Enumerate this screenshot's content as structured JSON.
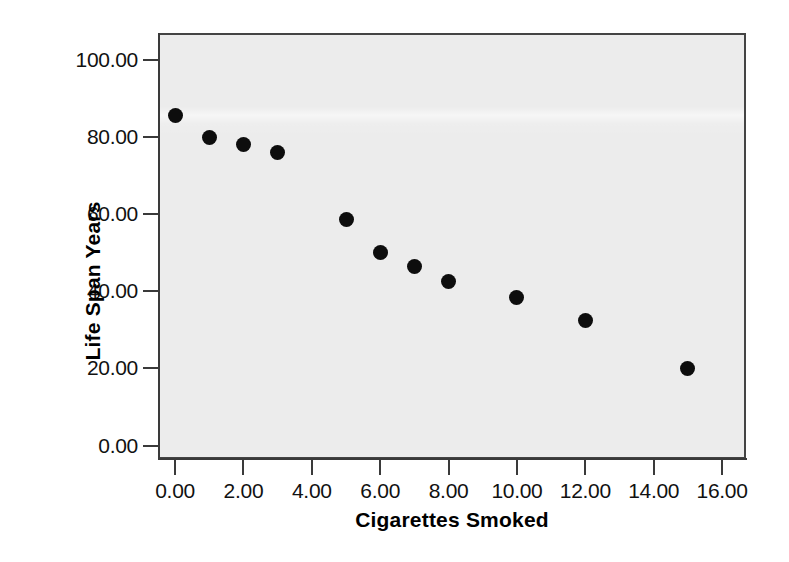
{
  "chart_data": {
    "type": "scatter",
    "title": "",
    "xlabel": "Cigarettes Smoked",
    "ylabel": "Life Span Years",
    "xlim": [
      -0.5,
      16.7
    ],
    "ylim": [
      -3.5,
      107.0
    ],
    "grid": false,
    "legend": null,
    "background_color": "#ececec",
    "point_color": "#0d0d0d",
    "x_ticks": [
      0,
      2,
      4,
      6,
      8,
      10,
      12,
      14,
      16
    ],
    "x_tick_labels": [
      "0.00",
      "2.00",
      "4.00",
      "6.00",
      "8.00",
      "10.00",
      "12.00",
      "14.00",
      "16.00"
    ],
    "y_ticks": [
      0,
      20,
      40,
      60,
      80,
      100
    ],
    "y_tick_labels": [
      "0.00",
      "20.00",
      "40.00",
      "60.00",
      "80.00",
      "100.00"
    ],
    "x": [
      0,
      1,
      2,
      3,
      5,
      6,
      7,
      8,
      10,
      12,
      15
    ],
    "y": [
      85.5,
      80.0,
      78.0,
      76.0,
      58.5,
      50.0,
      46.5,
      42.5,
      38.5,
      32.5,
      20.0
    ],
    "points": [
      {
        "x": 0,
        "y": 85.5
      },
      {
        "x": 1,
        "y": 80.0
      },
      {
        "x": 2,
        "y": 78.0
      },
      {
        "x": 3,
        "y": 76.0
      },
      {
        "x": 5,
        "y": 58.5
      },
      {
        "x": 6,
        "y": 50.0
      },
      {
        "x": 7,
        "y": 46.5
      },
      {
        "x": 8,
        "y": 42.5
      },
      {
        "x": 10,
        "y": 38.5
      },
      {
        "x": 12,
        "y": 32.5
      },
      {
        "x": 15,
        "y": 20.0
      }
    ]
  }
}
